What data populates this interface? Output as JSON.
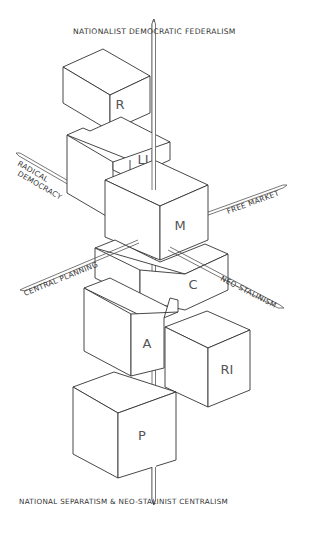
{
  "diagram": {
    "title_top": "Nationalist Democratic Federalism",
    "title_bottom": "National Separatism & Neo-Stalinist Centralism",
    "axes": {
      "vertical_top": "Nationalist Democratic Federalism",
      "vertical_bottom": "National Separatism & Neo-Stalinist Centralism",
      "upper_left": "Radical Democracy",
      "upper_left_line1": "Radical",
      "upper_left_line2": "Democracy",
      "right": "Free Market",
      "lower_left": "Central Planning",
      "lower_right": "Neo-Stalinism"
    },
    "cubes": [
      {
        "id": "R",
        "label": "R"
      },
      {
        "id": "LI",
        "label": "LI"
      },
      {
        "id": "M",
        "label": "M"
      },
      {
        "id": "C",
        "label": "C"
      },
      {
        "id": "A",
        "label": "A"
      },
      {
        "id": "RI",
        "label": "RI"
      },
      {
        "id": "P",
        "label": "P"
      }
    ],
    "colors": {
      "line": "#333333",
      "text": "#333333",
      "background": "#ffffff"
    }
  }
}
